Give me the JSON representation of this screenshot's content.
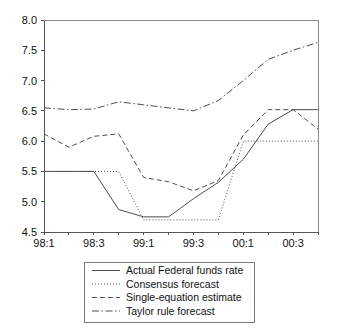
{
  "chart_data": {
    "type": "line",
    "title": "",
    "subtitle": "",
    "xlabel": "",
    "ylabel": "",
    "grid": false,
    "legend_position": "bottom",
    "x": [
      "98:1",
      "98:2",
      "98:3",
      "98:4",
      "99:1",
      "99:2",
      "99:3",
      "99:4",
      "00:1",
      "00:2",
      "00:3",
      "00:4"
    ],
    "xtick_labels": [
      "98:1",
      "98:3",
      "99:1",
      "99:3",
      "00:1",
      "00:3"
    ],
    "xtick_indices": [
      0,
      2,
      4,
      6,
      8,
      10
    ],
    "ytick_labels": [
      "4.5",
      "5.0",
      "5.5",
      "6.0",
      "6.5",
      "7.0",
      "7.5",
      "8.0"
    ],
    "ytick_values": [
      4.5,
      5.0,
      5.5,
      6.0,
      6.5,
      7.0,
      7.5,
      8.0
    ],
    "ylim": [
      4.5,
      8.0
    ],
    "series": [
      {
        "name": "Actual Federal funds rate",
        "style": "solid",
        "dasharray": "",
        "values": [
          5.5,
          5.5,
          5.5,
          4.87,
          4.75,
          4.75,
          5.05,
          5.32,
          5.7,
          6.28,
          6.52,
          6.52
        ]
      },
      {
        "name": "Consensus forecast",
        "style": "dotted",
        "dasharray": "1,2",
        "values": [
          5.5,
          5.5,
          5.5,
          5.5,
          4.7,
          4.7,
          4.7,
          4.7,
          6.0,
          6.0,
          6.0,
          6.0
        ]
      },
      {
        "name": "Single-equation estimate",
        "style": "dashed",
        "dasharray": "5,3",
        "values": [
          6.12,
          5.9,
          6.08,
          6.12,
          5.4,
          5.33,
          5.18,
          5.35,
          6.1,
          6.52,
          6.52,
          6.2
        ]
      },
      {
        "name": "Taylor rule forecast",
        "style": "dashdot",
        "dasharray": "7,2.5,1.5,2.5",
        "values": [
          6.55,
          6.52,
          6.53,
          6.65,
          6.6,
          6.55,
          6.5,
          6.67,
          7.0,
          7.35,
          7.5,
          7.63
        ]
      }
    ]
  },
  "legend": {
    "items": [
      {
        "label": "Actual Federal funds rate"
      },
      {
        "label": "Consensus forecast"
      },
      {
        "label": "Single-equation estimate"
      },
      {
        "label": "Taylor rule forecast"
      }
    ]
  }
}
